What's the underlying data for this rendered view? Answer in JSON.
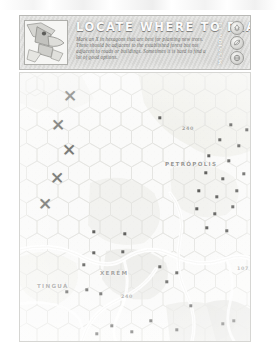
{
  "page": {
    "background_color": "#ffffff",
    "sheet_tint": "#fbfbfa"
  },
  "banner": {
    "title": "LOCATE WHERE TO PLANT TREES",
    "description": "Mark an X in hexagons that are best for planting new trees. These should be adjacent to the established forest but not adjacent to roads or buildings. Sometimes it is hard to find a lot of good options.",
    "mission_label": "MISSION 11",
    "mascot_icon": "toucan-mascot-icon",
    "background_color": "#d8d8d6",
    "title_color": "#fbfbfb",
    "badges": [
      {
        "name": "tree-badge",
        "icon": "tree-icon"
      },
      {
        "name": "leaf-badge",
        "icon": "leaf-icon"
      },
      {
        "name": "globe-badge",
        "icon": "globe-icon"
      }
    ]
  },
  "map": {
    "frame_color": "#d6d6d3",
    "hex_stroke_color": "#e2e2de",
    "forest_fill": "#e3e3df",
    "road_color": "#ffffff",
    "place_labels": [
      {
        "name": "petropolis-label",
        "text": "PETRÓPOLIS",
        "x": 164,
        "y": 163
      },
      {
        "name": "tingua-label",
        "text": "TINGUÁ",
        "x": 36,
        "y": 285
      },
      {
        "name": "xerem-label",
        "text": "XERÉM",
        "x": 99,
        "y": 272
      }
    ],
    "road_numbers": [
      {
        "name": "road-number-240-north",
        "text": "240",
        "x": 181,
        "y": 128
      },
      {
        "name": "road-number-240-south",
        "text": "240",
        "x": 120,
        "y": 296
      },
      {
        "name": "road-number-107",
        "text": "107",
        "x": 236,
        "y": 268
      }
    ],
    "x_marks": [
      {
        "name": "x-mark-1",
        "x": 69,
        "y": 95
      },
      {
        "name": "x-mark-2",
        "x": 57,
        "y": 124
      },
      {
        "name": "x-mark-3",
        "x": 68,
        "y": 149
      },
      {
        "name": "x-mark-4",
        "x": 56,
        "y": 177
      },
      {
        "name": "x-mark-5",
        "x": 44,
        "y": 203
      }
    ],
    "markers": [
      {
        "x": 159,
        "y": 117
      },
      {
        "x": 230,
        "y": 124
      },
      {
        "x": 246,
        "y": 129
      },
      {
        "x": 261,
        "y": 122
      },
      {
        "x": 219,
        "y": 139
      },
      {
        "x": 238,
        "y": 145
      },
      {
        "x": 255,
        "y": 141
      },
      {
        "x": 268,
        "y": 136
      },
      {
        "x": 208,
        "y": 155
      },
      {
        "x": 228,
        "y": 160
      },
      {
        "x": 249,
        "y": 157
      },
      {
        "x": 264,
        "y": 152
      },
      {
        "x": 205,
        "y": 172
      },
      {
        "x": 222,
        "y": 178
      },
      {
        "x": 243,
        "y": 173
      },
      {
        "x": 259,
        "y": 169
      },
      {
        "x": 198,
        "y": 190
      },
      {
        "x": 216,
        "y": 196
      },
      {
        "x": 236,
        "y": 190
      },
      {
        "x": 254,
        "y": 186
      },
      {
        "x": 269,
        "y": 193
      },
      {
        "x": 196,
        "y": 208
      },
      {
        "x": 214,
        "y": 213
      },
      {
        "x": 232,
        "y": 206
      },
      {
        "x": 250,
        "y": 210
      },
      {
        "x": 206,
        "y": 227
      },
      {
        "x": 226,
        "y": 230
      },
      {
        "x": 93,
        "y": 231
      },
      {
        "x": 124,
        "y": 233
      },
      {
        "x": 93,
        "y": 252
      },
      {
        "x": 122,
        "y": 251
      },
      {
        "x": 83,
        "y": 264
      },
      {
        "x": 159,
        "y": 266
      },
      {
        "x": 176,
        "y": 272
      },
      {
        "x": 166,
        "y": 281
      },
      {
        "x": 66,
        "y": 291
      },
      {
        "x": 86,
        "y": 289
      },
      {
        "x": 100,
        "y": 293
      },
      {
        "x": 190,
        "y": 305
      },
      {
        "x": 150,
        "y": 320
      },
      {
        "x": 111,
        "y": 325
      },
      {
        "x": 131,
        "y": 331
      },
      {
        "x": 96,
        "y": 333
      },
      {
        "x": 176,
        "y": 329
      },
      {
        "x": 222,
        "y": 323
      },
      {
        "x": 233,
        "y": 320
      },
      {
        "x": 252,
        "y": 309
      }
    ]
  }
}
